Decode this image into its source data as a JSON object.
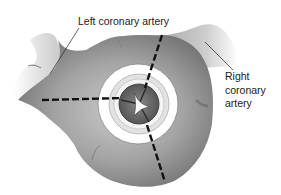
{
  "figure": {
    "labels": {
      "left_coronary": "Left coronary artery",
      "right_coronary_lines": [
        "Right",
        "coronary",
        "artery"
      ]
    },
    "colors": {
      "tissue": "#9a9a9a",
      "tissue_dark": "#6e6e6e",
      "tissue_light": "#d6d6d6",
      "ring": "#ffffff",
      "dash": "#111111",
      "text": "#1a1a1a"
    }
  }
}
